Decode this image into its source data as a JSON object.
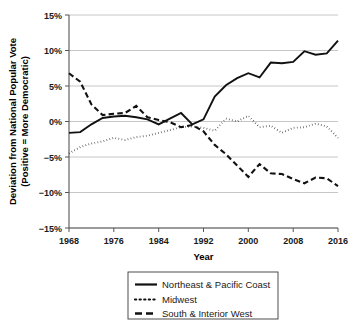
{
  "chart_data": {
    "type": "line",
    "title": "",
    "xlabel": "Year",
    "ylabel": "Deviation from National Popular Vote (Positive = More Democratic)",
    "ylabel_line1": "Deviation from National Popular Vote",
    "ylabel_line2": "(Positive = More Democratic)",
    "xlim": [
      1968,
      2016
    ],
    "ylim": [
      -15,
      15
    ],
    "grid": true,
    "legend_position": "below-center",
    "y_tick_labels": [
      "15%",
      "10%",
      "5%",
      "0%",
      "−5%",
      "−10%",
      "−15%"
    ],
    "y_tick_values": [
      15,
      10,
      5,
      0,
      -5,
      -10,
      -15
    ],
    "x_tick_labels": [
      "1968",
      "1976",
      "1984",
      "1992",
      "2000",
      "2008",
      "2016"
    ],
    "x_tick_values": [
      1968,
      1976,
      1984,
      1992,
      2000,
      2008,
      2016
    ],
    "x": [
      1968,
      1970,
      1972,
      1974,
      1976,
      1978,
      1980,
      1982,
      1984,
      1986,
      1988,
      1990,
      1992,
      1994,
      1996,
      1998,
      2000,
      2002,
      2004,
      2006,
      2008,
      2010,
      2012,
      2014,
      2016
    ],
    "series": [
      {
        "name": "Northeast & Pacific Coast",
        "style": "solid",
        "color": "#111111",
        "values": [
          -1.6,
          -1.5,
          -0.4,
          0.5,
          0.7,
          0.8,
          0.6,
          0.3,
          -0.4,
          0.4,
          1.2,
          -0.4,
          0.3,
          3.5,
          5.1,
          6.1,
          6.8,
          6.2,
          8.3,
          8.2,
          8.4,
          9.9,
          9.4,
          9.6,
          11.4
        ]
      },
      {
        "name": "Midwest",
        "style": "dotted",
        "color": "#111111",
        "values": [
          -4.5,
          -3.6,
          -3.1,
          -2.8,
          -2.3,
          -2.6,
          -2.2,
          -2.0,
          -1.6,
          -1.2,
          -0.8,
          -0.7,
          -0.9,
          -1.3,
          0.4,
          0.0,
          0.8,
          -0.8,
          -0.6,
          -1.6,
          -0.9,
          -0.8,
          -0.3,
          -0.7,
          -2.3
        ]
      },
      {
        "name": "South & Interior West",
        "style": "dashed",
        "color": "#111111",
        "values": [
          6.8,
          5.6,
          2.4,
          0.9,
          1.1,
          1.2,
          2.2,
          0.6,
          0.2,
          -0.1,
          -0.8,
          -0.5,
          -1.4,
          -3.3,
          -4.6,
          -6.2,
          -7.8,
          -6.0,
          -7.3,
          -7.4,
          -8.1,
          -8.7,
          -7.9,
          -8.0,
          -9.1
        ]
      }
    ],
    "legend": [
      {
        "label": "Northeast & Pacific Coast",
        "style": "solid"
      },
      {
        "label": "Midwest",
        "style": "dotted"
      },
      {
        "label": "South & Interior West",
        "style": "dashed"
      }
    ]
  }
}
